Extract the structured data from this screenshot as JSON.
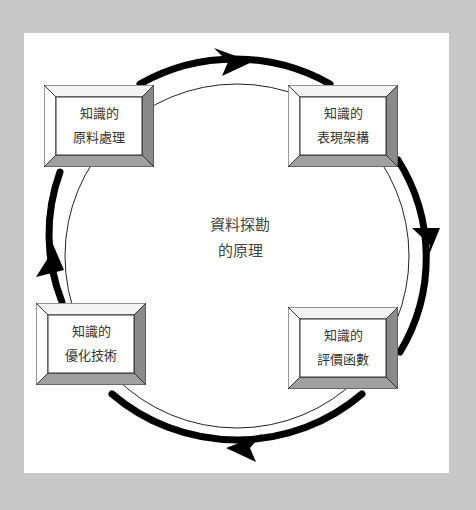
{
  "diagram": {
    "center": {
      "line1": "資料探勘",
      "line2": "的原理"
    },
    "nodes": [
      {
        "id": "top-left",
        "line1": "知識的",
        "line2": "原料處理"
      },
      {
        "id": "top-right",
        "line1": "知識的",
        "line2": "表現架構"
      },
      {
        "id": "bottom-right",
        "line1": "知識的",
        "line2": "評價函數"
      },
      {
        "id": "bottom-left",
        "line1": "知識的",
        "line2": "優化技術"
      }
    ],
    "flow_direction": "clockwise",
    "colors": {
      "background": "#c8c8c8",
      "panel": "#ffffff",
      "arrow": "#000000",
      "bevel_dark": "#8a8a8a",
      "bevel_mid": "#a0a0a0"
    }
  }
}
